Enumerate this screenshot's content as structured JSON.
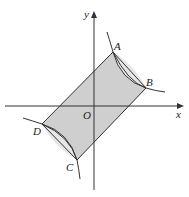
{
  "figure": {
    "axes": {
      "x_label": "x",
      "y_label": "y",
      "origin_label": "O"
    },
    "points": {
      "A": "A",
      "B": "B",
      "C": "C",
      "D": "D"
    },
    "colors": {
      "fill": "#cfcfcf",
      "stroke": "#333333",
      "background": "#ffffff"
    }
  }
}
